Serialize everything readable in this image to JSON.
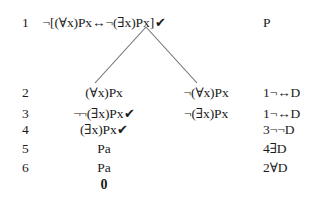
{
  "proof": {
    "title": "Truth Tree Derivation",
    "closure_marker": "0",
    "checkmark": "✔",
    "rows": [
      {
        "number": "1",
        "left": "¬[(∀x)Px↔¬(∃x)Px]",
        "left_checked": true,
        "right": "",
        "right_checked": false,
        "justification": "P"
      },
      {
        "number": "2",
        "left": "(∀x)Px",
        "left_checked": false,
        "right": "¬(∀x)Px",
        "right_checked": false,
        "justification": "1¬↔D"
      },
      {
        "number": "3",
        "left": "¬¬(∃x)Px",
        "left_checked": true,
        "right": "¬(∃x)Px",
        "right_checked": false,
        "justification": "1¬↔D"
      },
      {
        "number": "4",
        "left": "(∃x)Px",
        "left_checked": true,
        "right": "",
        "right_checked": false,
        "justification": "3¬¬D"
      },
      {
        "number": "5",
        "left": "Pa",
        "left_checked": false,
        "right": "",
        "right_checked": false,
        "justification": "4∃D"
      },
      {
        "number": "6",
        "left": "Pa",
        "left_checked": false,
        "right": "",
        "right_checked": false,
        "justification": "2∀D"
      }
    ],
    "branch_lines": {
      "color": "#6b6f75",
      "apex_x": 146,
      "apex_y": 27,
      "left_end_x": 95,
      "left_end_y": 83,
      "right_end_x": 197,
      "right_end_y": 83
    }
  }
}
